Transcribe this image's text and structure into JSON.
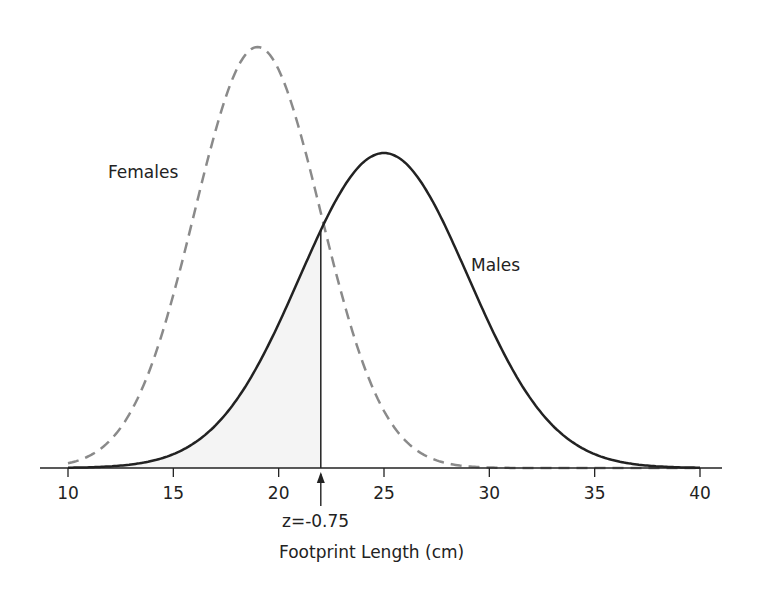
{
  "chart_data": {
    "type": "line",
    "title": "",
    "xlabel": "Footprint Length (cm)",
    "ylabel": "",
    "xlim": [
      10,
      40
    ],
    "xticks": [
      10,
      15,
      20,
      25,
      30,
      35,
      40
    ],
    "grid": false,
    "series": [
      {
        "name": "Females",
        "distribution": "normal",
        "mean": 19,
        "sd": 3,
        "style": "dashed",
        "color": "#8a8a8a"
      },
      {
        "name": "Males",
        "distribution": "normal",
        "mean": 25,
        "sd": 4,
        "style": "solid",
        "color": "#222222"
      }
    ],
    "annotations": [
      {
        "text": "z=-0.75",
        "x": 22,
        "type": "vertical-line-with-arrow",
        "shaded_region": "Males curve, x < 22"
      }
    ]
  },
  "labels": {
    "females": "Females",
    "males": "Males",
    "z_marker": "z=-0.75",
    "x_axis_title": "Footprint Length (cm)",
    "ticks": [
      "10",
      "15",
      "20",
      "25",
      "30",
      "35",
      "40"
    ]
  }
}
